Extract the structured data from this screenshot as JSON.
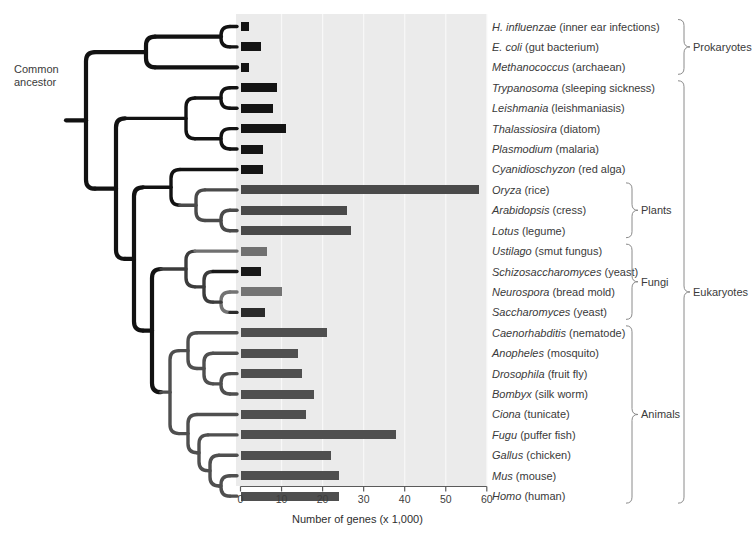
{
  "figure": {
    "ancestor_label_line1": "Common",
    "ancestor_label_line2": "ancestor",
    "plot_bg": "#ebebeb",
    "axis_color": "#5a5a5a"
  },
  "chart_data": {
    "type": "bar",
    "title": "",
    "xlabel": "Number of genes (x 1,000)",
    "ylabel": "",
    "xlim": [
      0,
      60
    ],
    "xticks": [
      0,
      10,
      20,
      30,
      40,
      50,
      60
    ],
    "grid": true,
    "orientation": "horizontal",
    "legend_position": "none",
    "categories": [
      "H. influenzae",
      "E. coli",
      "Methanococcus",
      "Trypanosoma",
      "Leishmania",
      "Thalassiosira",
      "Plasmodium",
      "Cyanidioschyzon",
      "Oryza",
      "Arabidopsis",
      "Lotus",
      "Ustilago",
      "Schizosaccharomyces",
      "Neurospora",
      "Saccharomyces",
      "Caenorhabditis",
      "Anopheles",
      "Drosophila",
      "Bombyx",
      "Ciona",
      "Fugu",
      "Gallus",
      "Mus",
      "Homo"
    ],
    "values": [
      2,
      5,
      2,
      9,
      8,
      11,
      5.5,
      5.5,
      58,
      26,
      27,
      6.5,
      5,
      10,
      6,
      21,
      14,
      15,
      18,
      16,
      38,
      22,
      24,
      24
    ],
    "bar_colors": [
      "#141414",
      "#141414",
      "#141414",
      "#141414",
      "#141414",
      "#141414",
      "#141414",
      "#141414",
      "#4a4a4a",
      "#4a4a4a",
      "#4a4a4a",
      "#707070",
      "#181818",
      "#737373",
      "#2b2b2b",
      "#4f4f4f",
      "#4f4f4f",
      "#4f4f4f",
      "#4f4f4f",
      "#4f4f4f",
      "#4f4f4f",
      "#4f4f4f",
      "#4f4f4f",
      "#4f4f4f"
    ]
  },
  "taxa": [
    {
      "genus": "H. influenzae",
      "common": "(inner ear infections)"
    },
    {
      "genus": "E. coli",
      "common": "(gut bacterium)"
    },
    {
      "genus": "Methanococcus",
      "common": "(archaean)"
    },
    {
      "genus": "Trypanosoma",
      "common": "(sleeping sickness)"
    },
    {
      "genus": "Leishmania",
      "common": "(leishmaniasis)"
    },
    {
      "genus": "Thalassiosira",
      "common": "(diatom)"
    },
    {
      "genus": "Plasmodium",
      "common": "(malaria)"
    },
    {
      "genus": "Cyanidioschyzon",
      "common": "(red alga)"
    },
    {
      "genus": "Oryza",
      "common": "(rice)"
    },
    {
      "genus": "Arabidopsis",
      "common": "(cress)"
    },
    {
      "genus": "Lotus",
      "common": "(legume)"
    },
    {
      "genus": "Ustilago",
      "common": "(smut fungus)"
    },
    {
      "genus": "Schizosaccharomyces",
      "common": "(yeast)"
    },
    {
      "genus": "Neurospora",
      "common": "(bread mold)"
    },
    {
      "genus": "Saccharomyces",
      "common": "(yeast)"
    },
    {
      "genus": "Caenorhabditis",
      "common": "(nematode)"
    },
    {
      "genus": "Anopheles",
      "common": "(mosquito)"
    },
    {
      "genus": "Drosophila",
      "common": "(fruit fly)"
    },
    {
      "genus": "Bombyx",
      "common": "(silk worm)"
    },
    {
      "genus": "Ciona",
      "common": "(tunicate)"
    },
    {
      "genus": "Fugu",
      "common": "(puffer fish)"
    },
    {
      "genus": "Gallus",
      "common": "(chicken)"
    },
    {
      "genus": "Mus",
      "common": "(mouse)"
    },
    {
      "genus": "Homo",
      "common": "(human)"
    }
  ],
  "groups": {
    "inner": [
      {
        "label": "Plants",
        "first": 8,
        "last": 10
      },
      {
        "label": "Fungi",
        "first": 11,
        "last": 14
      },
      {
        "label": "Animals",
        "first": 15,
        "last": 23
      }
    ],
    "outer": [
      {
        "label": "Prokaryotes",
        "first": 0,
        "last": 2
      },
      {
        "label": "Eukaryotes",
        "first": 3,
        "last": 23
      }
    ]
  }
}
